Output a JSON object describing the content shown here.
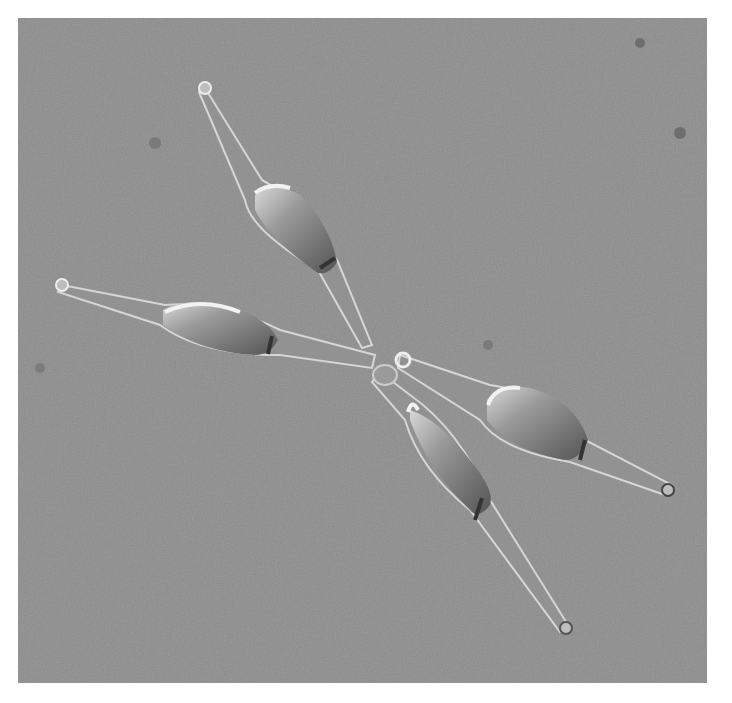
{
  "image": {
    "description": "Differential interference contrast micrograph of four spindle-shaped diatom cells joined at a central point forming an X-shaped colony",
    "background_color": "#8c8c8c",
    "border_color": "#ffffff",
    "cells": [
      {
        "name": "upper-left-cell",
        "tip": [
          205,
          88
        ],
        "base": [
          372,
          345
        ],
        "body_center": [
          298,
          225
        ]
      },
      {
        "name": "left-cell",
        "tip": [
          62,
          285
        ],
        "base": [
          375,
          360
        ],
        "body_center": [
          222,
          325
        ]
      },
      {
        "name": "right-cell",
        "tip": [
          668,
          490
        ],
        "base": [
          400,
          360
        ],
        "body_center": [
          535,
          425
        ]
      },
      {
        "name": "lower-cell",
        "tip": [
          566,
          628
        ],
        "base": [
          390,
          378
        ],
        "body_center": [
          455,
          470
        ]
      }
    ],
    "debris_spots": [
      [
        640,
        43
      ],
      [
        155,
        143
      ],
      [
        680,
        133
      ],
      [
        488,
        345
      ],
      [
        40,
        368
      ]
    ]
  }
}
